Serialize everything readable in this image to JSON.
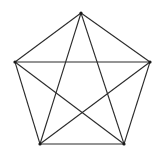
{
  "diagram": {
    "type": "complete-graph",
    "name": "K5",
    "colors": {
      "edge": "#2b2b2b",
      "vertex": "#1a1a1a",
      "background": "#ffffff"
    },
    "vertices": [
      {
        "id": "top",
        "x": 81,
        "y": 13
      },
      {
        "id": "right",
        "x": 150,
        "y": 62
      },
      {
        "id": "bottom-right",
        "x": 124,
        "y": 144
      },
      {
        "id": "bottom-left",
        "x": 40,
        "y": 144
      },
      {
        "id": "left",
        "x": 15,
        "y": 62
      }
    ],
    "edges": [
      [
        "top",
        "right"
      ],
      [
        "right",
        "bottom-right"
      ],
      [
        "bottom-right",
        "bottom-left"
      ],
      [
        "bottom-left",
        "left"
      ],
      [
        "left",
        "top"
      ],
      [
        "top",
        "bottom-right"
      ],
      [
        "top",
        "bottom-left"
      ],
      [
        "right",
        "bottom-left"
      ],
      [
        "right",
        "left"
      ],
      [
        "bottom-right",
        "left"
      ]
    ]
  }
}
